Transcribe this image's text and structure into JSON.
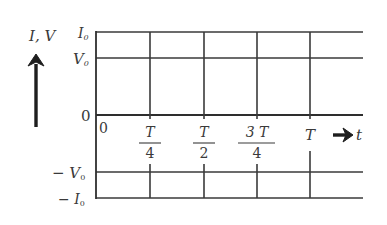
{
  "figure": {
    "y_axis_label": "I,  V",
    "x_axis_label": "t",
    "origin_label": "0",
    "y_ticks": [
      {
        "sign": "",
        "symbol": "I",
        "sub": "0",
        "level": "top"
      },
      {
        "sign": "",
        "symbol": "V",
        "sub": "0",
        "level": "upper"
      },
      {
        "sign": "",
        "symbol": "0",
        "sub": "",
        "level": "zero"
      },
      {
        "sign": "− ",
        "symbol": "V",
        "sub": "0",
        "level": "lower"
      },
      {
        "sign": "− ",
        "symbol": "I",
        "sub": "0",
        "level": "bottom"
      }
    ],
    "x_ticks": [
      {
        "num": "T",
        "den": "4"
      },
      {
        "num": "T",
        "den": "2"
      },
      {
        "num": "3 T",
        "den": "4"
      },
      {
        "num": "T",
        "den": ""
      }
    ],
    "y_arrow_icon": "up-arrow",
    "x_arrow_icon": "right-arrow",
    "colors": {
      "line": "#3a3a3a",
      "arrow": "#1e1e1e",
      "background": "#ffffff"
    }
  }
}
